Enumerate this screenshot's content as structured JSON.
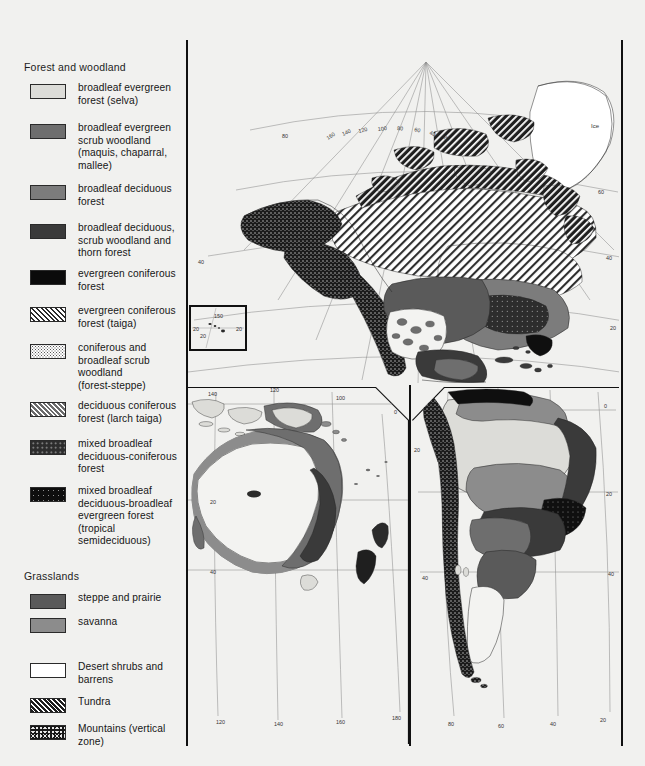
{
  "map": {
    "title_groups": [
      {
        "id": "forest",
        "label": "Forest and woodland"
      },
      {
        "id": "grassland",
        "label": "Grasslands"
      }
    ],
    "legend_forest": [
      {
        "label": "broadleaf evergreen\nforest (selva)",
        "pattern": "pale",
        "color": "#dcdcd8"
      },
      {
        "label": "broadleaf evergreen\nscrub woodland\n(maquis, chaparral,\nmallee)",
        "pattern": "mid",
        "color": "#6e6e6e"
      },
      {
        "label": "broadleaf deciduous\nforest",
        "pattern": "mid2",
        "color": "#7c7c7c"
      },
      {
        "label": "broadleaf deciduous,\nscrub woodland and\nthorn forest",
        "pattern": "dark",
        "color": "#3a3a3a"
      },
      {
        "label": "evergreen coniferous\nforest",
        "pattern": "black",
        "color": "#0b0b0b"
      },
      {
        "label": "evergreen coniferous\nforest (taiga)",
        "pattern": "taiga",
        "color": "#ffffff"
      },
      {
        "label": "coniferous and\nbroadleaf scrub\nwoodland\n(forest-steppe)",
        "pattern": "stipple",
        "color": "#ffffff"
      },
      {
        "label": "deciduous coniferous\nforest (larch taiga)",
        "pattern": "larch",
        "color": "#6a6a6a"
      },
      {
        "label": "mixed broadleaf\ndeciduous-coniferous\nforest",
        "pattern": "mixed1",
        "color": "#2c2c2c"
      },
      {
        "label": "mixed broadleaf\ndeciduous-broadleaf\nevergreen forest\n(tropical\nsemideciduous)",
        "pattern": "mixed2",
        "color": "#0e0e0e"
      }
    ],
    "legend_grassland": [
      {
        "label": "steppe and prairie",
        "pattern": "grey-md",
        "color": "#5a5a5a"
      },
      {
        "label": "savanna",
        "pattern": "savanna",
        "color": "#8c8c8c"
      }
    ],
    "legend_other": [
      {
        "label": "Desert shrubs and\nbarrens",
        "pattern": "white",
        "color": "#f3f3f1"
      },
      {
        "label": "Tundra",
        "pattern": "tundra",
        "color": "#1e1e1e"
      },
      {
        "label": "Mountains (vertical\nzone)",
        "pattern": "mountain",
        "color": "#171717"
      }
    ],
    "annotations": [
      {
        "id": "ice-label",
        "text": "Ice"
      }
    ],
    "graticule_labels": {
      "north_america_longitudes": [
        "160",
        "140",
        "120",
        "100",
        "80",
        "60",
        "40",
        "20"
      ],
      "north_america_left_latitudes": [
        "80",
        "40",
        "20"
      ],
      "north_america_right_latitudes": [
        "60",
        "40",
        "20"
      ],
      "inset_labels": [
        "150",
        "20",
        "20"
      ],
      "australia_top_longitudes": [
        "140",
        "120",
        "100"
      ],
      "australia_bottom_longitudes": [
        "120",
        "140",
        "160",
        "180"
      ],
      "australia_latitudes": [
        "20",
        "40"
      ],
      "south_america_bottom_longitudes": [
        "80",
        "60",
        "40",
        "20"
      ],
      "south_america_latitudes": [
        "0",
        "20",
        "40"
      ],
      "pacific_extra": [
        "0",
        "160",
        "180",
        "20",
        "40"
      ]
    }
  }
}
